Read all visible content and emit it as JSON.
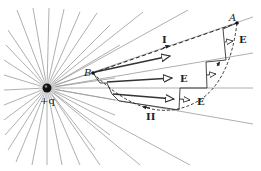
{
  "diagram": {
    "charge": {
      "label": "+q",
      "x": 47,
      "y": 88
    },
    "points": {
      "A": {
        "label": "A",
        "x": 237,
        "y": 23
      },
      "B": {
        "label": "B",
        "x": 93,
        "y": 73
      }
    },
    "paths": {
      "I": {
        "label": "I",
        "style": "dashed straight"
      },
      "II": {
        "label": "II",
        "style": "stepped radial and arc segments"
      }
    },
    "field_label": "E",
    "colors": {
      "field_lines": "#9a9a9a",
      "arrows": "#333333",
      "path": "#222222",
      "background": "#ffffff"
    }
  }
}
